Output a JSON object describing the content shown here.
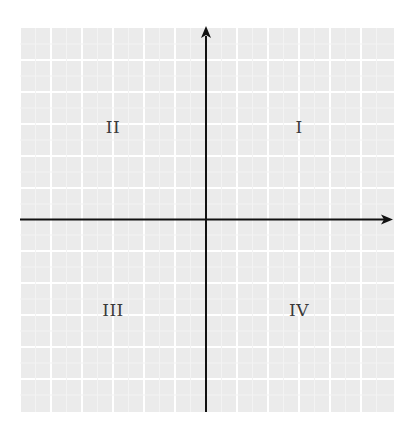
{
  "diagram": {
    "title": "",
    "type": "cartesian-coordinate-plane",
    "grid": {
      "columns": 12,
      "rows": 12,
      "background_color": "#ebebeb",
      "line_color": "#ffffff"
    },
    "axes": {
      "color": "#111111",
      "x_axis": {
        "label": "",
        "arrow": "right"
      },
      "y_axis": {
        "label": "",
        "arrow": "up"
      }
    },
    "quadrants": [
      {
        "id": "q1",
        "label": "I"
      },
      {
        "id": "q2",
        "label": "II"
      },
      {
        "id": "q3",
        "label": "III"
      },
      {
        "id": "q4",
        "label": "IV"
      }
    ]
  }
}
